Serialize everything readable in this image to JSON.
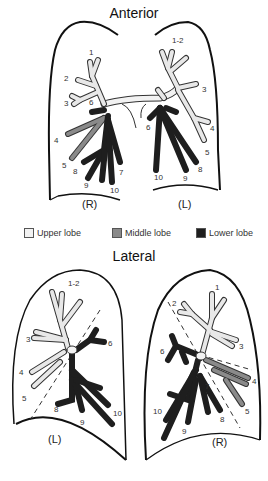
{
  "titles": {
    "anterior": "Anterior",
    "lateral": "Lateral"
  },
  "colors": {
    "upper_lobe": "#dcdcdc",
    "middle_lobe": "#8a8a8a",
    "lower_lobe": "#1e1e1e",
    "outline": "#111111"
  },
  "legend": [
    {
      "label": "Upper lobe",
      "color": "#f2f2f2"
    },
    {
      "label": "Middle lobe",
      "color": "#8a8a8a"
    },
    {
      "label": "Lower lobe",
      "color": "#1e1e1e"
    }
  ],
  "anterior": {
    "right": {
      "side_label": "(R)",
      "segments": [
        "1",
        "2",
        "3",
        "4",
        "5",
        "6",
        "7",
        "8",
        "9",
        "10"
      ]
    },
    "left": {
      "side_label": "(L)",
      "segments": [
        "1-2",
        "3",
        "4",
        "5",
        "6",
        "8",
        "9",
        "10"
      ]
    }
  },
  "lateral": {
    "left": {
      "side_label": "(L)",
      "segments": [
        "1-2",
        "3",
        "4",
        "5",
        "6",
        "8",
        "9",
        "10"
      ]
    },
    "right": {
      "side_label": "(R)",
      "segments": [
        "1",
        "2",
        "3",
        "4",
        "5",
        "6",
        "7",
        "8",
        "9",
        "10"
      ]
    }
  }
}
